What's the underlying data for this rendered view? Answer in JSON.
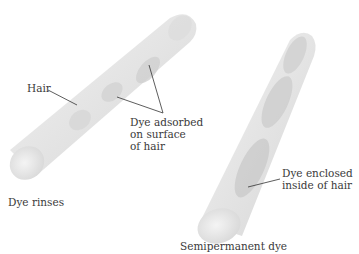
{
  "diagram": {
    "panels": [
      {
        "caption": "Dye rinses",
        "labels": {
          "hair": "Hair",
          "dye_line1": "Dye adsorbed",
          "dye_line2": "on surface",
          "dye_line3": "of hair"
        }
      },
      {
        "caption": "Semipermanent dye",
        "labels": {
          "dye_line1": "Dye enclosed",
          "dye_line2": "inside of hair"
        }
      }
    ],
    "colors": {
      "hair_fill": "#e6e6e6",
      "hair_edge": "#d0d0d0",
      "dye_patch": "#c9c9c9",
      "leader_line": "#333333"
    }
  }
}
